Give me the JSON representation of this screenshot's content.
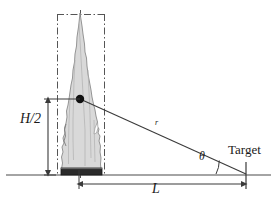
{
  "figure": {
    "background_color": "#ffffff",
    "width": 277,
    "height": 205
  },
  "labels": {
    "flame_half_height": "H/2",
    "horizontal_distance": "L",
    "radial_distance": "r",
    "angle": "θ",
    "target": "Target"
  },
  "colors": {
    "line": "#3a3a3a",
    "flame_fill": "#d9d9d9",
    "flame_stroke": "#808080",
    "pool_fill": "#2b2b2b",
    "pool_top": "#4a4a4a",
    "dashdot": "#555555",
    "ground": "#4a4a4a",
    "text": "#1a1a1a"
  },
  "geometry": {
    "ground_line": {
      "x1": 6,
      "y1": 175,
      "x2": 271,
      "y2": 175
    },
    "flame_center_point": {
      "x": 80,
      "y": 99
    },
    "target_point": {
      "x": 246,
      "y": 174
    },
    "bounding_box": {
      "x": 57,
      "y": 14,
      "width": 48,
      "height": 161
    },
    "height_arrow": {
      "x": 48,
      "y_top": 98,
      "y_bottom": 175
    },
    "length_arrow": {
      "y": 184,
      "x_left": 78,
      "x_right": 246
    },
    "angle_arc_radius": 30
  },
  "elements": {
    "flame_name": "flame-plume",
    "pool_name": "fuel-pool",
    "ray_name": "radiation-ray"
  }
}
